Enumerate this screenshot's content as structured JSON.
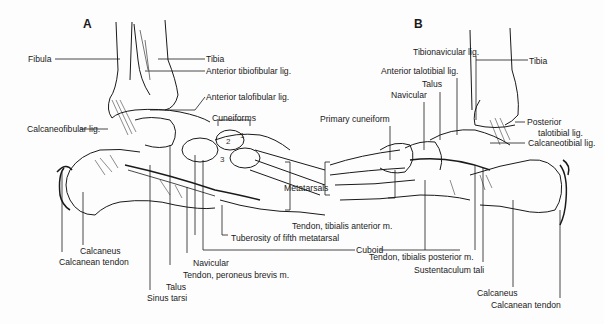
{
  "figure": {
    "panels": [
      {
        "id": "A",
        "label": "A"
      },
      {
        "id": "B",
        "label": "B"
      }
    ],
    "panel_a": {
      "labels": {
        "fibula": "Fibula",
        "tibia": "Tibia",
        "ant_tibiofibular": "Anterior tibiofibular lig.",
        "ant_talofibular": "Anterior talofibular lig.",
        "cuneiforms": "Cuneiforms",
        "calcaneofibular": "Calcaneofibular lig.",
        "metatarsals": "Metatarsals",
        "tendon_tib_ant": "Tendon, tibialis anterior m.",
        "tuberosity": "Tuberosity of  fifth metatarsal",
        "cuboid": "Cuboid",
        "navicular": "Navicular",
        "tendon_peroneus": "Tendon, peroneus brevis m.",
        "talus": "Talus",
        "sinus_tarsi": "Sinus tarsi",
        "calcaneus": "Calcaneus",
        "calcanean_tendon": "Calcanean tendon"
      },
      "cuneiform_numbers": [
        "1",
        "2",
        "3"
      ]
    },
    "panel_b": {
      "labels": {
        "tibionavicular": "Tibionavicular lig.",
        "tibia": "Tibia",
        "ant_talotibial": "Anterior talotibial lig.",
        "talus": "Talus",
        "navicular": "Navicular",
        "primary_cuneiform": "Primary cuneiform",
        "post_talotibial_1": "Posterior",
        "post_talotibial_2": "talotibial lig.",
        "calcaneotibial": "Calcaneotibial lig.",
        "tendon_tib_post": "Tendon, tibialis posterior m.",
        "sustentaculum": "Sustentaculum tali",
        "calcaneus": "Calcaneus",
        "calcanean_tendon": "Calcanean tendon"
      }
    }
  }
}
